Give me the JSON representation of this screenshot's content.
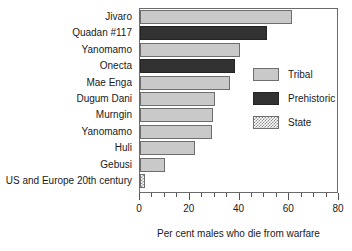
{
  "chart_data": {
    "type": "bar",
    "orientation": "horizontal",
    "title": "",
    "xlabel": "Per cent males who die from warfare",
    "ylabel": "",
    "xlim": [
      0,
      80
    ],
    "ylim": null,
    "grid": false,
    "xticks": [
      0,
      20,
      40,
      60,
      80
    ],
    "xtick_labels": [
      "0",
      "20",
      "40",
      "60",
      "80"
    ],
    "xminor_tick_step": 5,
    "legend_position": "right-inside",
    "categories": [
      "Jivaro",
      "Quadan #117",
      "Yanomamo",
      "Onecta",
      "Mae Enga",
      "Dugum Dani",
      "Murngin",
      "Yanomamo",
      "Huli",
      "Gebusi",
      "US and Europe 20th century"
    ],
    "values": [
      61,
      51,
      40,
      38,
      36,
      30,
      29.5,
      29,
      22,
      10,
      2
    ],
    "groups": [
      "Tribal",
      "Prehistoric",
      "Tribal",
      "Prehistoric",
      "Tribal",
      "Tribal",
      "Tribal",
      "Tribal",
      "Tribal",
      "Tribal",
      "State"
    ],
    "series": [
      {
        "name": "Tribal",
        "color": "#c9c9c9",
        "fill": "solid"
      },
      {
        "name": "Prehistoric",
        "color": "#323232",
        "fill": "solid"
      },
      {
        "name": "State",
        "color": "#8f8f8f",
        "fill": "checkered"
      }
    ]
  },
  "legend": {
    "items": [
      {
        "label": "Tribal"
      },
      {
        "label": "Prehistoric"
      },
      {
        "label": "State"
      }
    ]
  }
}
